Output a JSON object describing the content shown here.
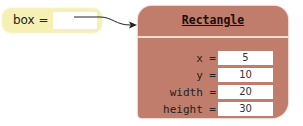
{
  "variable": {
    "label": "box ="
  },
  "object": {
    "class_name": "Rectangle",
    "fields": [
      {
        "name": "x =",
        "value": "5"
      },
      {
        "name": "y =",
        "value": "10"
      },
      {
        "name": "width =",
        "value": "20"
      },
      {
        "name": "height =",
        "value": "30"
      }
    ]
  },
  "colors": {
    "variable_bg": "#f6f0b4",
    "object_bg": "#c07d6c",
    "divider": "#f4dccb",
    "arrow": "#222222"
  }
}
